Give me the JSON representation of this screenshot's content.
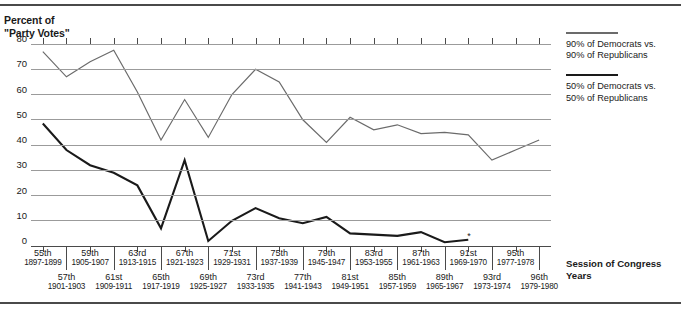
{
  "chart_title": "Percent of\n\"Party Votes\"",
  "axis_caption": "Session of Congress\nYears",
  "legend": [
    {
      "name": "legend-90",
      "swatch": "thin-line",
      "text": "90% of Democrats vs.\n90% of Republicans"
    },
    {
      "name": "legend-50",
      "swatch": "thick-line",
      "text": "50% of Democrats vs.\n50% of Republicans"
    }
  ],
  "colors": {
    "line_90": "#6b6b6b",
    "line_50": "#1a1a1a",
    "gridline": "#9b9b9b",
    "axis": "#4a4a4a"
  },
  "chart_data": {
    "type": "line",
    "title": "Percent of \"Party Votes\"",
    "xlabel": "Session of Congress / Years",
    "ylabel": "Percent of \"Party Votes\"",
    "ylim": [
      0,
      80
    ],
    "yticks": [
      0,
      10,
      20,
      30,
      40,
      50,
      60,
      70,
      80
    ],
    "grid": true,
    "legend_position": "right",
    "note": "Thick (50%) series ends at the 91st Congress, marked with an asterisk.",
    "categories": [
      "55th",
      "57th",
      "59th",
      "61st",
      "63rd",
      "65th",
      "67th",
      "69th",
      "71st",
      "73rd",
      "75th",
      "77th",
      "79th",
      "81st",
      "83rd",
      "85th",
      "87th",
      "89th",
      "91st",
      "93rd",
      "95th",
      "96th"
    ],
    "category_years": [
      "1897-1899",
      "1901-1903",
      "1905-1907",
      "1909-1911",
      "1913-1915",
      "1917-1919",
      "1921-1923",
      "1925-1927",
      "1929-1931",
      "1933-1935",
      "1937-1939",
      "1941-1943",
      "1945-1947",
      "1949-1951",
      "1953-1955",
      "1957-1959",
      "1961-1963",
      "1965-1967",
      "1969-1970",
      "1973-1974",
      "1977-1978",
      "1979-1980"
    ],
    "series": [
      {
        "name": "90% of Democrats vs. 90% of Republicans",
        "color": "#6b6b6b",
        "values": [
          77,
          67,
          73,
          77.5,
          61,
          42,
          58,
          43,
          60,
          70,
          65,
          50,
          41,
          51,
          46,
          48,
          44.5,
          45,
          44,
          34,
          38,
          42
        ]
      },
      {
        "name": "50% of Democrats vs. 50% of Republicans",
        "color": "#1a1a1a",
        "values": [
          48.5,
          38,
          32,
          29,
          24,
          7,
          34,
          2,
          10,
          15,
          11,
          9,
          11.5,
          5,
          4.5,
          4,
          5.5,
          1.5,
          2.5,
          null,
          null,
          null
        ]
      }
    ]
  },
  "x_label_groups": [
    {
      "num": "55th",
      "yr": "1897-1899",
      "row": 0
    },
    {
      "num": "57th",
      "yr": "1901-1903",
      "row": 1
    },
    {
      "num": "59th",
      "yr": "1905-1907",
      "row": 0
    },
    {
      "num": "61st",
      "yr": "1909-1911",
      "row": 1
    },
    {
      "num": "63rd",
      "yr": "1913-1915",
      "row": 0
    },
    {
      "num": "65th",
      "yr": "1917-1919",
      "row": 1
    },
    {
      "num": "67th",
      "yr": "1921-1923",
      "row": 0
    },
    {
      "num": "69th",
      "yr": "1925-1927",
      "row": 1
    },
    {
      "num": "71st",
      "yr": "1929-1931",
      "row": 0
    },
    {
      "num": "73rd",
      "yr": "1933-1935",
      "row": 1
    },
    {
      "num": "75th",
      "yr": "1937-1939",
      "row": 0
    },
    {
      "num": "77th",
      "yr": "1941-1943",
      "row": 1
    },
    {
      "num": "79th",
      "yr": "1945-1947",
      "row": 0
    },
    {
      "num": "81st",
      "yr": "1949-1951",
      "row": 1
    },
    {
      "num": "83rd",
      "yr": "1953-1955",
      "row": 0
    },
    {
      "num": "85th",
      "yr": "1957-1959",
      "row": 1
    },
    {
      "num": "87th",
      "yr": "1961-1963",
      "row": 0
    },
    {
      "num": "89th",
      "yr": "1965-1967",
      "row": 1
    },
    {
      "num": "91st",
      "yr": "1969-1970",
      "row": 0
    },
    {
      "num": "93rd",
      "yr": "1973-1974",
      "row": 1
    },
    {
      "num": "95th",
      "yr": "1977-1978",
      "row": 0
    },
    {
      "num": "96th",
      "yr": "1979-1980",
      "row": 1
    }
  ]
}
